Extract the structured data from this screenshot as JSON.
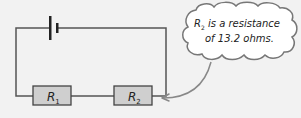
{
  "diagram": {
    "type": "circuit",
    "components": [
      {
        "id": "battery",
        "kind": "cell"
      },
      {
        "id": "R1",
        "kind": "resistor",
        "label_main": "R",
        "label_sub": "1"
      },
      {
        "id": "R2",
        "kind": "resistor",
        "label_main": "R",
        "label_sub": "2"
      }
    ],
    "callout": {
      "line1_main": "R",
      "line1_sub": "2",
      "line1_rest": " is a resistance",
      "line2": "of 13.2 ohms.",
      "points_to": "R2"
    },
    "colors": {
      "background": "#f2f2f2",
      "wire": "#555555",
      "resistor_fill": "#cfcfcf",
      "resistor_stroke": "#444444",
      "cloud_fill": "#ffffff",
      "cloud_stroke": "#777777",
      "arrow": "#888888"
    }
  }
}
